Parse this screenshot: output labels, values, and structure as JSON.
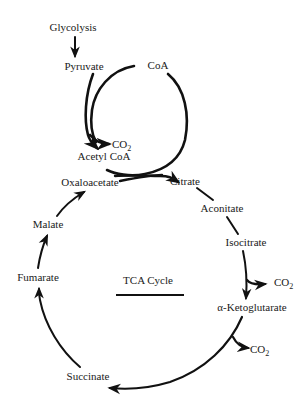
{
  "diagram": {
    "title": "TCA Cycle",
    "colors": {
      "ink": "#111111",
      "background": "#ffffff"
    },
    "inputs": {
      "glycolysis": "Glycolysis",
      "pyruvate": "Pyruvate",
      "coa": "CoA",
      "co2_pdh": "CO",
      "co2_pdh_sub": "2",
      "acetyl_coa": "Acetyl CoA"
    },
    "cycle": {
      "oxaloacetate": "Oxaloacetate",
      "citrate": "Citrate",
      "aconitate": "Aconitate",
      "isocitrate": "Isocitrate",
      "co2_idh": "CO",
      "co2_idh_sub": "2",
      "alpha_ketoglutarate": "α-Ketoglutarate",
      "co2_akgdh": "CO",
      "co2_akgdh_sub": "2",
      "succinate": "Succinate",
      "fumarate": "Fumarate",
      "malate": "Malate"
    },
    "nodes_order": [
      "Oxaloacetate",
      "Citrate",
      "Aconitate",
      "Isocitrate",
      "α-Ketoglutarate",
      "Succinate",
      "Fumarate",
      "Malate"
    ],
    "edges": [
      {
        "from": "Glycolysis",
        "to": "Pyruvate"
      },
      {
        "from": "Pyruvate",
        "to": "Acetyl CoA",
        "byproduct": "CO2",
        "cofactor": "CoA"
      },
      {
        "from": "Acetyl CoA",
        "to": "Citrate",
        "with": "Oxaloacetate",
        "releases": "CoA"
      },
      {
        "from": "Citrate",
        "to": "Aconitate"
      },
      {
        "from": "Aconitate",
        "to": "Isocitrate"
      },
      {
        "from": "Isocitrate",
        "to": "α-Ketoglutarate",
        "byproduct": "CO2"
      },
      {
        "from": "α-Ketoglutarate",
        "to": "Succinate",
        "byproduct": "CO2"
      },
      {
        "from": "Succinate",
        "to": "Fumarate"
      },
      {
        "from": "Fumarate",
        "to": "Malate"
      },
      {
        "from": "Malate",
        "to": "Oxaloacetate"
      }
    ]
  }
}
